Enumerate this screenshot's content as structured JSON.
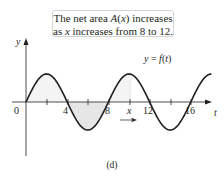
{
  "callout": {
    "line1": "The net area A(x) increases",
    "line2": "as x increases from 8 to 12."
  },
  "caption": "(d)",
  "chart_data": {
    "type": "line",
    "title": "",
    "function_label": "y = f(t)",
    "xlabel": "t",
    "ylabel": "y",
    "x_ticks": [
      "0",
      "4",
      "8",
      "x",
      "12",
      "16"
    ],
    "x_tick_values": [
      0,
      2,
      4,
      6,
      8,
      10,
      12,
      14,
      16
    ],
    "curve": "sinusoid f(t) = sin(pi*t/4), period 8, from t=0 to t~18",
    "shaded_regions": [
      {
        "from": 0,
        "to": 4,
        "sign": "positive"
      },
      {
        "from": 4,
        "to": 8,
        "sign": "negative"
      },
      {
        "from": 8,
        "to": 10,
        "sign": "positive"
      }
    ],
    "annotation": "arrow under x pointing right",
    "grid": false
  },
  "colors": {
    "curve": "#231f20",
    "shade": "#ececec",
    "axis": "#231f20"
  }
}
